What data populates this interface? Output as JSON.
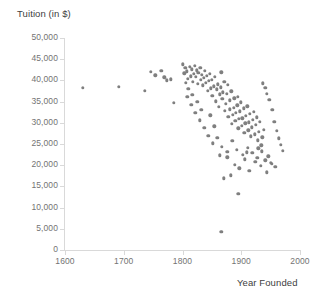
{
  "chart_data": {
    "type": "scatter",
    "title": "",
    "xlabel": "Year Founded",
    "ylabel": "Tuition (in $)",
    "xlim": [
      1600,
      2000
    ],
    "ylim": [
      0,
      50000
    ],
    "xticks": [
      1600,
      1700,
      1800,
      1900,
      2000
    ],
    "xtick_labels": [
      "1600",
      "1700",
      "1800",
      "1900",
      "2000"
    ],
    "yticks": [
      0,
      5000,
      10000,
      15000,
      20000,
      25000,
      30000,
      35000,
      40000,
      45000,
      50000
    ],
    "ytick_labels": [
      "0",
      "5,000",
      "10,000",
      "15,000",
      "20,000",
      "25,000",
      "30,000",
      "35,000",
      "40,000",
      "45,000",
      "50,000"
    ],
    "grid": false,
    "legend": false,
    "marker_color": "#7f7f7f",
    "axis_color": "#d9d9d9",
    "points": [
      [
        1630,
        38300
      ],
      [
        1692,
        38500
      ],
      [
        1736,
        37500
      ],
      [
        1746,
        42000
      ],
      [
        1754,
        41200
      ],
      [
        1764,
        42300
      ],
      [
        1769,
        40700
      ],
      [
        1773,
        40000
      ],
      [
        1780,
        40300
      ],
      [
        1785,
        34700
      ],
      [
        1800,
        43800
      ],
      [
        1803,
        41700
      ],
      [
        1805,
        43000
      ],
      [
        1807,
        42100
      ],
      [
        1809,
        40400
      ],
      [
        1812,
        43200
      ],
      [
        1814,
        41000
      ],
      [
        1816,
        42600
      ],
      [
        1818,
        39600
      ],
      [
        1819,
        41500
      ],
      [
        1821,
        43500
      ],
      [
        1823,
        40900
      ],
      [
        1824,
        42400
      ],
      [
        1826,
        39200
      ],
      [
        1827,
        41800
      ],
      [
        1830,
        42900
      ],
      [
        1831,
        40100
      ],
      [
        1833,
        41300
      ],
      [
        1835,
        38800
      ],
      [
        1836,
        40600
      ],
      [
        1838,
        42200
      ],
      [
        1840,
        39400
      ],
      [
        1841,
        41100
      ],
      [
        1843,
        37600
      ],
      [
        1845,
        39900
      ],
      [
        1846,
        41600
      ],
      [
        1848,
        38100
      ],
      [
        1850,
        40200
      ],
      [
        1851,
        36300
      ],
      [
        1853,
        38600
      ],
      [
        1855,
        40800
      ],
      [
        1857,
        35100
      ],
      [
        1858,
        37900
      ],
      [
        1860,
        39100
      ],
      [
        1862,
        33800
      ],
      [
        1863,
        36700
      ],
      [
        1865,
        38400
      ],
      [
        1866,
        41900
      ],
      [
        1868,
        35600
      ],
      [
        1869,
        37200
      ],
      [
        1871,
        39700
      ],
      [
        1872,
        32900
      ],
      [
        1874,
        34500
      ],
      [
        1875,
        36900
      ],
      [
        1877,
        38900
      ],
      [
        1878,
        31400
      ],
      [
        1880,
        33200
      ],
      [
        1881,
        35300
      ],
      [
        1883,
        37400
      ],
      [
        1884,
        29800
      ],
      [
        1886,
        31900
      ],
      [
        1887,
        33600
      ],
      [
        1888,
        35800
      ],
      [
        1890,
        30400
      ],
      [
        1891,
        32300
      ],
      [
        1893,
        34100
      ],
      [
        1894,
        36100
      ],
      [
        1895,
        28700
      ],
      [
        1896,
        30900
      ],
      [
        1898,
        32700
      ],
      [
        1899,
        34800
      ],
      [
        1901,
        29300
      ],
      [
        1902,
        31100
      ],
      [
        1904,
        33400
      ],
      [
        1905,
        27600
      ],
      [
        1907,
        29900
      ],
      [
        1908,
        31700
      ],
      [
        1910,
        33900
      ],
      [
        1912,
        28200
      ],
      [
        1913,
        30100
      ],
      [
        1915,
        32100
      ],
      [
        1916,
        26800
      ],
      [
        1918,
        28900
      ],
      [
        1920,
        30700
      ],
      [
        1921,
        32600
      ],
      [
        1923,
        27300
      ],
      [
        1925,
        29500
      ],
      [
        1926,
        31300
      ],
      [
        1928,
        25900
      ],
      [
        1930,
        27900
      ],
      [
        1932,
        30200
      ],
      [
        1934,
        24700
      ],
      [
        1936,
        26600
      ],
      [
        1938,
        28400
      ],
      [
        1808,
        36200
      ],
      [
        1815,
        34300
      ],
      [
        1822,
        32400
      ],
      [
        1829,
        30600
      ],
      [
        1837,
        28800
      ],
      [
        1844,
        27000
      ],
      [
        1852,
        25200
      ],
      [
        1859,
        26400
      ],
      [
        1867,
        24300
      ],
      [
        1876,
        23100
      ],
      [
        1885,
        25700
      ],
      [
        1892,
        23600
      ],
      [
        1903,
        22400
      ],
      [
        1911,
        24100
      ],
      [
        1919,
        22900
      ],
      [
        1927,
        21700
      ],
      [
        1935,
        23300
      ],
      [
        1941,
        21200
      ],
      [
        1946,
        22100
      ],
      [
        1952,
        20400
      ],
      [
        1876,
        21900
      ],
      [
        1889,
        20100
      ],
      [
        1897,
        19300
      ],
      [
        1906,
        21400
      ],
      [
        1914,
        18700
      ],
      [
        1924,
        20800
      ],
      [
        1933,
        19900
      ],
      [
        1943,
        18300
      ],
      [
        1950,
        20600
      ],
      [
        1958,
        19600
      ],
      [
        1866,
        4300
      ],
      [
        1895,
        13200
      ],
      [
        1870,
        16900
      ],
      [
        1882,
        17600
      ],
      [
        1944,
        36800
      ],
      [
        1948,
        35400
      ],
      [
        1953,
        33100
      ],
      [
        1956,
        30300
      ],
      [
        1961,
        28100
      ],
      [
        1964,
        26300
      ],
      [
        1967,
        24800
      ],
      [
        1971,
        23400
      ],
      [
        1941,
        38200
      ],
      [
        1937,
        39300
      ],
      [
        1929,
        24000
      ],
      [
        1909,
        23000
      ],
      [
        1863,
        22300
      ],
      [
        1854,
        29200
      ],
      [
        1847,
        31800
      ],
      [
        1832,
        33000
      ],
      [
        1825,
        35000
      ],
      [
        1817,
        36600
      ],
      [
        1810,
        38000
      ],
      [
        1806,
        39500
      ]
    ]
  }
}
